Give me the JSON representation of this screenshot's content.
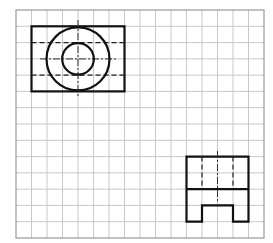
{
  "figure": {
    "grid": {
      "columns": 16,
      "rows": 14,
      "origin_px": [
        16,
        10
      ],
      "cell_px": [
        15.5,
        16.3
      ],
      "line_color": "#c8c8c8",
      "frame_color": "#9a9a9a"
    },
    "top_view": {
      "rect_cells": {
        "x": 1,
        "y": 1,
        "w": 6,
        "h": 4
      },
      "outer_circle_radius_cells": 2,
      "inner_circle_radius_cells": 1,
      "center_cells": [
        4,
        3
      ],
      "hidden_lines_y_cells": [
        2,
        4
      ]
    },
    "front_view": {
      "rect_cells": {
        "x": 11,
        "y": 9,
        "w": 4,
        "h": 4
      },
      "mid_line_y_cells": 11,
      "hidden_lines_x_cells": [
        12,
        14
      ],
      "center_line_x_cells": 13,
      "notch_cells": {
        "x": 12,
        "y": 12,
        "w": 2,
        "h": 1
      }
    },
    "stroke_color": "#111111"
  }
}
